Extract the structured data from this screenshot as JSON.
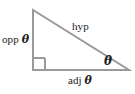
{
  "figure": {
    "name": "right-triangle-trigonometry-diagram",
    "background_color": "#ffffff",
    "stroke_color": "#9a9a9a",
    "text_color": "#1c1c1c",
    "stroke_width": 2,
    "geometry": {
      "apex": [
        33,
        10
      ],
      "right_angle_vertex": [
        33,
        70
      ],
      "theta_vertex": [
        129,
        70
      ],
      "right_angle_marker": {
        "x": 33,
        "y": 58,
        "size": 12
      }
    },
    "labels": {
      "opposite_word": "opp",
      "opposite_symbol": "θ",
      "hypotenuse": "hyp",
      "adjacent_word": "adj",
      "adjacent_symbol": "θ",
      "angle_symbol": "θ"
    }
  }
}
